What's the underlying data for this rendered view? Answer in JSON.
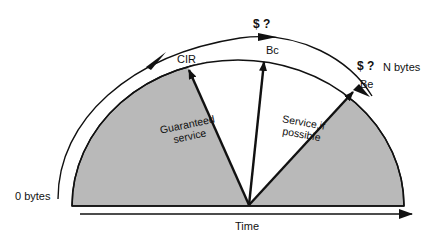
{
  "diagram": {
    "type": "frame-relay-rate-semicircle",
    "labels": {
      "cir": "CIR",
      "bc": "Bc",
      "be": "Be",
      "cost_bc": "$ ?",
      "cost_be": "$ ?",
      "n_bytes": "N bytes",
      "zero_bytes": "0 bytes",
      "time": "Time",
      "guaranteed_line1": "Guaranteed",
      "guaranteed_line2": "service",
      "possible_line1": "Service,if",
      "possible_line2": "possible"
    },
    "colors": {
      "shaded_region": "#b9b9b9",
      "stroke": "#111111",
      "background": "#ffffff"
    }
  }
}
